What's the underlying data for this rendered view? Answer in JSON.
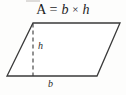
{
  "figure": {
    "background_color": "#fdfdfc",
    "stroke_color": "#3a3a3a",
    "text_color": "#1c1c1c"
  },
  "formula": {
    "area_symbol": "A",
    "equals": "=",
    "base_var": "b",
    "times": "×",
    "height_var": "h",
    "full_text": "A = b × h"
  },
  "labels": {
    "height": "h",
    "base": "b"
  },
  "geometry": {
    "shape": "parallelogram",
    "vertices": {
      "top_left": [
        33,
        23
      ],
      "top_right": [
        120,
        23
      ],
      "bottom_right": [
        97,
        76
      ],
      "bottom_left": [
        7,
        76
      ]
    },
    "height_line": {
      "from": [
        33,
        23
      ],
      "to": [
        33,
        76
      ],
      "style": "dashed"
    },
    "base_edge": {
      "from": [
        7,
        76
      ],
      "to": [
        97,
        76
      ]
    }
  }
}
